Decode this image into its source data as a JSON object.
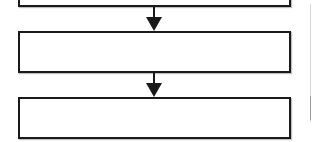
{
  "diagram": {
    "type": "vertical-flowchart",
    "boxes": [
      {
        "id": "box-1",
        "label": "",
        "partially_visible": true
      },
      {
        "id": "box-2",
        "label": ""
      },
      {
        "id": "box-3",
        "label": ""
      }
    ],
    "arrows": [
      {
        "from": "box-1",
        "to": "box-2",
        "direction": "down"
      },
      {
        "from": "box-2",
        "to": "box-3",
        "direction": "down"
      }
    ],
    "colors": {
      "stroke": "#1a1a1a",
      "fill": "#ffffff",
      "background": "#ffffff",
      "side_line": "#d6d6d6"
    }
  }
}
